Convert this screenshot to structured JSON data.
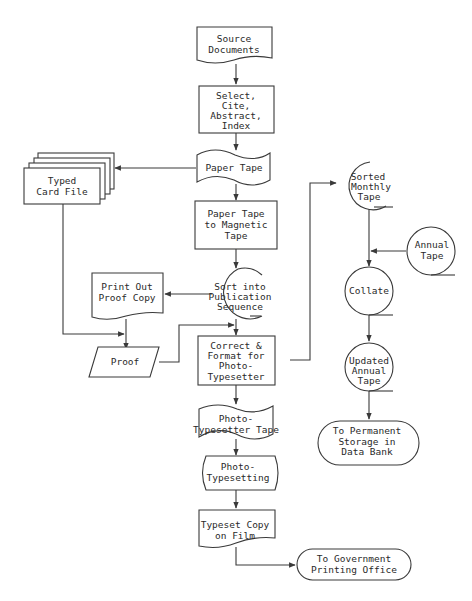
{
  "diagram": {
    "type": "flowchart",
    "colors": {
      "stroke": "#3a3a3a",
      "text": "#2a2a2a",
      "background": "#ffffff"
    },
    "nodes": {
      "source_documents": {
        "shape": "document",
        "lines": [
          "Source",
          "Documents"
        ]
      },
      "select_cite": {
        "shape": "process",
        "lines": [
          "Select,",
          "Cite,",
          "Abstract,",
          "Index"
        ]
      },
      "paper_tape": {
        "shape": "punched-tape",
        "lines": [
          "Paper Tape"
        ]
      },
      "typed_card_file": {
        "shape": "card-deck",
        "lines": [
          "Typed",
          "Card File"
        ]
      },
      "paper_to_magnetic": {
        "shape": "process",
        "lines": [
          "Paper Tape",
          "to Magnetic",
          "Tape"
        ]
      },
      "sort_publication": {
        "shape": "magnetic-tape",
        "lines": [
          "Sort into",
          "Publication",
          "Sequence"
        ]
      },
      "print_proof": {
        "shape": "document",
        "lines": [
          "Print Out",
          "Proof Copy"
        ]
      },
      "proof": {
        "shape": "input-output",
        "lines": [
          "Proof"
        ]
      },
      "correct_format": {
        "shape": "process",
        "lines": [
          "Correct &",
          "Format for",
          "Photo-",
          "Typesetter"
        ]
      },
      "sorted_monthly": {
        "shape": "magnetic-tape",
        "lines": [
          "Sorted",
          "Monthly",
          "Tape"
        ]
      },
      "annual_tape": {
        "shape": "magnetic-tape",
        "lines": [
          "Annual",
          "Tape"
        ]
      },
      "collate": {
        "shape": "magnetic-tape",
        "lines": [
          "Collate"
        ]
      },
      "updated_annual": {
        "shape": "magnetic-tape",
        "lines": [
          "Updated",
          "Annual",
          "Tape"
        ]
      },
      "permanent_storage": {
        "shape": "terminal",
        "lines": [
          "To Permanent",
          "Storage in",
          "Data Bank"
        ]
      },
      "phototypesetter_tape": {
        "shape": "punched-tape",
        "lines": [
          "Photo-",
          "Typesetter Tape"
        ]
      },
      "phototypesetting": {
        "shape": "display",
        "lines": [
          "Photo-",
          "Typesetting"
        ]
      },
      "typeset_copy": {
        "shape": "document",
        "lines": [
          "Typeset Copy",
          "on Film"
        ]
      },
      "gov_printing": {
        "shape": "terminal",
        "lines": [
          "To Government",
          "Printing Office"
        ]
      }
    },
    "edges": [
      [
        "source_documents",
        "select_cite"
      ],
      [
        "select_cite",
        "paper_tape"
      ],
      [
        "paper_tape",
        "typed_card_file"
      ],
      [
        "paper_tape",
        "paper_to_magnetic"
      ],
      [
        "paper_to_magnetic",
        "sort_publication"
      ],
      [
        "sort_publication",
        "print_proof"
      ],
      [
        "print_proof",
        "proof"
      ],
      [
        "typed_card_file",
        "proof"
      ],
      [
        "proof",
        "correct_format"
      ],
      [
        "sort_publication",
        "correct_format"
      ],
      [
        "correct_format",
        "sorted_monthly"
      ],
      [
        "sorted_monthly",
        "collate"
      ],
      [
        "annual_tape",
        "collate"
      ],
      [
        "collate",
        "updated_annual"
      ],
      [
        "updated_annual",
        "permanent_storage"
      ],
      [
        "correct_format",
        "phototypesetter_tape"
      ],
      [
        "phototypesetter_tape",
        "phototypesetting"
      ],
      [
        "phototypesetting",
        "typeset_copy"
      ],
      [
        "typeset_copy",
        "gov_printing"
      ]
    ]
  }
}
